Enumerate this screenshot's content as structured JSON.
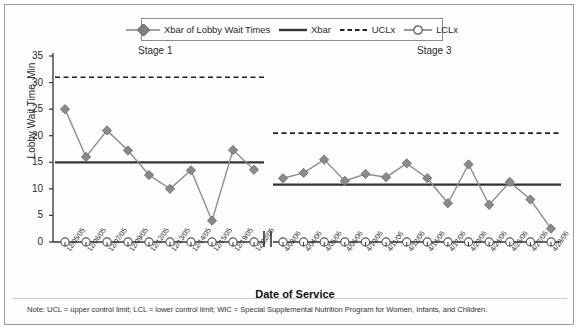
{
  "legend": {
    "items": [
      {
        "label": "Xbar of Lobby Wait Times",
        "marker": "diamond-line",
        "color": "#808080"
      },
      {
        "label": "Xbar",
        "marker": "solid-line",
        "color": "#333333"
      },
      {
        "label": "UCLx",
        "marker": "dashed-line",
        "color": "#222222"
      },
      {
        "label": "LCLx",
        "marker": "circle-line",
        "color": "#555555"
      }
    ]
  },
  "stages": {
    "stage1_label": "Stage 1",
    "stage3_label": "Stage 3"
  },
  "axes": {
    "ylabel": "Lobby Wait Time, Min",
    "xlabel": "Date of Service",
    "yticks": [
      "0",
      "5",
      "10",
      "15",
      "20",
      "25",
      "30",
      "35"
    ],
    "ymin": 0,
    "ymax": 35
  },
  "footnote": "Note: UCL = upper control limit; LCL = lower control limit; WIC = Special Supplemental Nutrition Program for Women, Infants, and Children.",
  "chart_data": {
    "type": "line",
    "title": "",
    "subtitle": "",
    "xlabel": "Date of Service",
    "ylabel": "Lobby Wait Time, Min",
    "ylim": [
      0,
      35
    ],
    "ytick_step": 5,
    "grid": false,
    "legend_position": "top-center",
    "axis_break": true,
    "stages": [
      {
        "name": "Stage 1",
        "categories": [
          "12/05/05",
          "12/06/05",
          "12/07/05",
          "12/09/05",
          "12/12/05",
          "12/13/05",
          "12/14/05",
          "12/15/05",
          "12/19/05",
          "12/22/05"
        ],
        "series": [
          {
            "name": "Xbar of Lobby Wait Times",
            "values": [
              25.0,
              16.0,
              21.0,
              17.2,
              12.6,
              10.0,
              13.5,
              4.0,
              17.3,
              13.6
            ]
          },
          {
            "name": "Xbar",
            "value": 15.0
          },
          {
            "name": "UCLx",
            "value": 31.0
          },
          {
            "name": "LCLx",
            "value": 0.0
          }
        ]
      },
      {
        "name": "Stage 3",
        "categories": [
          "4/03/06",
          "4/04/06",
          "4/05/06",
          "4/06/06",
          "4/10/06",
          "4/11/06",
          "4/12/06",
          "4/14/06",
          "4/17/06",
          "4/20/06",
          "4/24/06",
          "4/26/06",
          "4/27/06",
          "4/28/06"
        ],
        "series": [
          {
            "name": "Xbar of Lobby Wait Times",
            "values": [
              12.0,
              13.0,
              15.5,
              11.5,
              12.8,
              12.2,
              14.8,
              12.0,
              7.3,
              14.6,
              7.0,
              11.3,
              8.0,
              2.5
            ]
          },
          {
            "name": "Xbar",
            "value": 10.8
          },
          {
            "name": "UCLx",
            "value": 20.5
          },
          {
            "name": "LCLx",
            "value": 0.0
          }
        ]
      }
    ]
  }
}
